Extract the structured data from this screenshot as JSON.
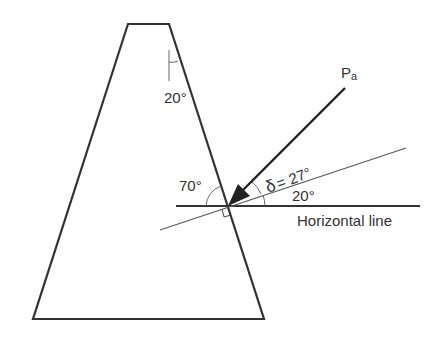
{
  "diagram": {
    "labels": {
      "top_angle": "20°",
      "wall_angle": "70°",
      "delta": "δ = 27°",
      "delta_symbol": "δ",
      "delta_eq": "= 27°",
      "incline_angle": "20°",
      "force": "P",
      "force_sub": "a",
      "horizontal": "Horizontal line"
    },
    "colors": {
      "line": "#333333",
      "thin_line": "#555555",
      "background": "#ffffff"
    }
  }
}
